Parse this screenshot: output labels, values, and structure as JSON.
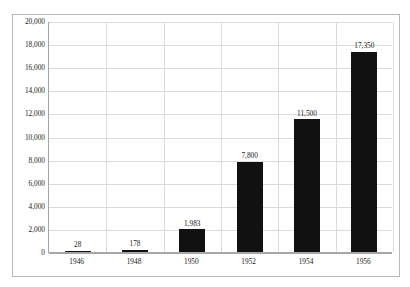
{
  "chart_data": {
    "type": "bar",
    "title": "",
    "subtitle": "",
    "xlabel": "",
    "ylabel": "",
    "categories": [
      "1946",
      "1948",
      "1950",
      "1952",
      "1954",
      "1956"
    ],
    "values": [
      28,
      178,
      1983,
      7800,
      11500,
      17350
    ],
    "data_labels": [
      "28",
      "178",
      "1,983",
      "7,800",
      "11,500",
      "17,350"
    ],
    "ylim": [
      0,
      20000
    ],
    "ytick_step": 2000,
    "ytick_labels": [
      "0",
      "2,000",
      "4,000",
      "6,000",
      "8,000",
      "10,000",
      "12,000",
      "14,000",
      "16,000",
      "18,000",
      "20,000"
    ],
    "ytick_values": [
      0,
      2000,
      4000,
      6000,
      8000,
      10000,
      12000,
      14000,
      16000,
      18000,
      20000
    ],
    "grid": {
      "horizontal": true,
      "vertical": true,
      "color": "#dcdcdc"
    },
    "legend": {
      "visible": false,
      "position": "none",
      "entries": []
    },
    "series": [
      {
        "name": "",
        "color": "#111111",
        "values": [
          28,
          178,
          1983,
          7800,
          11500,
          17350
        ]
      }
    ],
    "annotations": []
  },
  "style": {
    "bar_color": "#111111",
    "plot_background": "#ffffff",
    "axis_line_color": "#a6a6a6",
    "frame_border_color": "#b9b9b9",
    "text_color": "#1a1a1a"
  }
}
